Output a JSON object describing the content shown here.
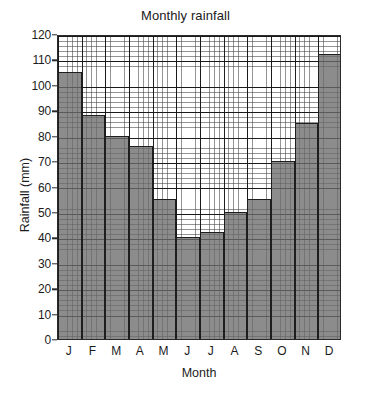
{
  "chart_data": {
    "type": "bar",
    "title": "Monthly rainfall",
    "xlabel": "Month",
    "ylabel": "Rainfall (mm)",
    "categories": [
      "J",
      "F",
      "M",
      "A",
      "M",
      "J",
      "J",
      "A",
      "S",
      "O",
      "N",
      "D"
    ],
    "category_full_names": [
      "January",
      "February",
      "March",
      "April",
      "May",
      "June",
      "July",
      "August",
      "September",
      "October",
      "November",
      "December"
    ],
    "values": [
      105,
      88,
      80,
      76,
      55,
      40,
      42,
      50,
      55,
      70,
      85,
      112
    ],
    "ylim": [
      0,
      120
    ],
    "ytick_values": [
      0,
      10,
      20,
      30,
      40,
      50,
      60,
      70,
      80,
      90,
      100,
      110,
      120
    ],
    "ytick_labels": [
      "0",
      "10",
      "20",
      "30",
      "40",
      "50",
      "60",
      "70",
      "80",
      "90",
      "100",
      "110",
      "120"
    ],
    "ymajor_step": 10,
    "yminor_step": 2,
    "xminor_divisions_per_category": 5,
    "grid": "major-and-minor",
    "legend": "none",
    "bar_fill_color": "#6c6c6c",
    "bar_edge_color": "#1e1e1e",
    "grid_major_color": "#141414",
    "grid_minor_color": "#3c3c3c",
    "plot_background": "#ffffff",
    "axis_color": "#2a2a2a"
  }
}
